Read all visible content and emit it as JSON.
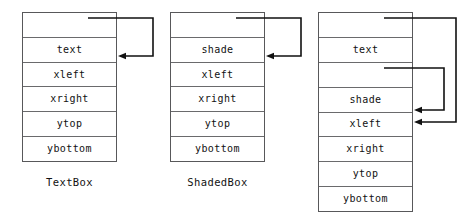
{
  "diagram": {
    "kind": "object-memory-layout",
    "boxes": [
      {
        "name": "text-box-object",
        "label": "TextBox",
        "x": 22,
        "y": 12,
        "width": 95,
        "height": 150,
        "rows": [
          {
            "slot": "vptr",
            "text": ""
          },
          {
            "slot": "text",
            "text": "text"
          },
          {
            "slot": "xleft",
            "text": "xleft"
          },
          {
            "slot": "xright",
            "text": "xright"
          },
          {
            "slot": "ytop",
            "text": "ytop"
          },
          {
            "slot": "ybottom",
            "text": "ybottom"
          }
        ]
      },
      {
        "name": "shaded-box-object",
        "label": "ShadedBox",
        "x": 170,
        "y": 12,
        "width": 95,
        "height": 150,
        "rows": [
          {
            "slot": "vptr",
            "text": ""
          },
          {
            "slot": "shade",
            "text": "shade"
          },
          {
            "slot": "xleft",
            "text": "xleft"
          },
          {
            "slot": "xright",
            "text": "xright"
          },
          {
            "slot": "ytop",
            "text": "ytop"
          },
          {
            "slot": "ybottom",
            "text": "ybottom"
          }
        ]
      },
      {
        "name": "shaded-text-box-object",
        "label": "",
        "x": 318,
        "y": 12,
        "width": 95,
        "height": 200,
        "rows": [
          {
            "slot": "vptr-1",
            "text": ""
          },
          {
            "slot": "text",
            "text": "text"
          },
          {
            "slot": "vptr-2",
            "text": ""
          },
          {
            "slot": "shade",
            "text": "shade"
          },
          {
            "slot": "xleft",
            "text": "xleft"
          },
          {
            "slot": "xright",
            "text": "xright"
          },
          {
            "slot": "ytop",
            "text": "ytop"
          },
          {
            "slot": "ybottom",
            "text": "ybottom"
          }
        ]
      }
    ],
    "labels": [
      {
        "name": "text-box-label",
        "text": "TextBox",
        "x": 22,
        "width": 95,
        "y": 176
      },
      {
        "name": "shaded-box-label",
        "text": "ShadedBox",
        "x": 170,
        "width": 95,
        "y": 176
      }
    ],
    "arrows": [
      {
        "name": "textbox-vptr-arrow",
        "from_slot": "vptr",
        "to_slot": "xleft",
        "start": {
          "x": 88,
          "y": 18
        },
        "corner_x": 153,
        "end": {
          "x": 118,
          "y": 56
        }
      },
      {
        "name": "shadedbox-vptr-arrow",
        "from_slot": "vptr",
        "to_slot": "xleft",
        "start": {
          "x": 236,
          "y": 18
        },
        "corner_x": 301,
        "end": {
          "x": 266,
          "y": 56
        }
      },
      {
        "name": "shadedtextbox-vptr1-arrow",
        "from_slot": "vptr-1",
        "to_slot": "xleft",
        "start": {
          "x": 384,
          "y": 18
        },
        "corner_x": 456,
        "end": {
          "x": 414,
          "y": 122
        }
      },
      {
        "name": "shadedtextbox-vptr2-arrow",
        "from_slot": "vptr-2",
        "to_slot": "shade",
        "start": {
          "x": 384,
          "y": 68
        },
        "corner_x": 444,
        "end": {
          "x": 414,
          "y": 110
        }
      }
    ],
    "colors": {
      "box_border": "#58585a",
      "row_divider": "#6a6a6c",
      "arrow": "#111111",
      "text": "#111111",
      "background": "#ffffff"
    }
  }
}
